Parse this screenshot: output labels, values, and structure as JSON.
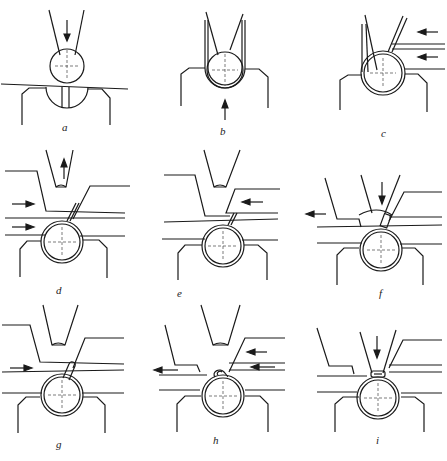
{
  "figure": {
    "panels": [
      {
        "id": "a",
        "label": "a"
      },
      {
        "id": "b",
        "label": "b"
      },
      {
        "id": "c",
        "label": "c"
      },
      {
        "id": "d",
        "label": "d"
      },
      {
        "id": "e",
        "label": "e"
      },
      {
        "id": "f",
        "label": "f"
      },
      {
        "id": "g",
        "label": "g"
      },
      {
        "id": "h",
        "label": "h"
      },
      {
        "id": "i",
        "label": "i"
      }
    ]
  },
  "colors": {
    "line": "#1a1a1a",
    "background": "#ffffff"
  }
}
